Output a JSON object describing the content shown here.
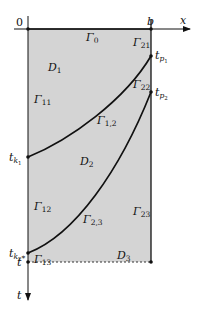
{
  "diagram": {
    "type": "domain-partition",
    "fill_color": "#d4d4d4",
    "stroke_color": "#111111",
    "axes": {
      "origin_label": "0",
      "x_label": "x",
      "x_end_label": "b",
      "t_label": "t",
      "t_end_label": "t*"
    },
    "regions": [
      {
        "id": "D1",
        "label": "D",
        "sub": "1"
      },
      {
        "id": "D2",
        "label": "D",
        "sub": "2"
      },
      {
        "id": "D3",
        "label": "D",
        "sub": "3"
      }
    ],
    "boundaries": [
      {
        "id": "G0",
        "label": "Γ",
        "sub": "0"
      },
      {
        "id": "G11",
        "label": "Γ",
        "sub": "11"
      },
      {
        "id": "G12",
        "label": "Γ",
        "sub": "12"
      },
      {
        "id": "G13",
        "label": "Γ",
        "sub": "13"
      },
      {
        "id": "G21",
        "label": "Γ",
        "sub": "21"
      },
      {
        "id": "G22",
        "label": "Γ",
        "sub": "22"
      },
      {
        "id": "G23",
        "label": "Γ",
        "sub": "23"
      },
      {
        "id": "G1_2",
        "label": "Γ",
        "sub": "1,2"
      },
      {
        "id": "G2_3",
        "label": "Γ",
        "sub": "2,3"
      }
    ],
    "points": [
      {
        "id": "tk1",
        "label": "t",
        "sub": "k",
        "subsub": "1"
      },
      {
        "id": "tk2",
        "label": "t",
        "sub": "k",
        "subsub": "2"
      },
      {
        "id": "tp1",
        "label": "t",
        "sub": "p",
        "subsub": "1"
      },
      {
        "id": "tp2",
        "label": "t",
        "sub": "p",
        "subsub": "2"
      }
    ]
  }
}
